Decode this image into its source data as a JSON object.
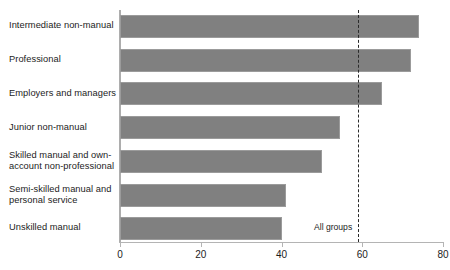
{
  "chart_data": {
    "type": "bar",
    "orientation": "horizontal",
    "title": "",
    "xlabel": "",
    "ylabel": "",
    "xlim": [
      0,
      80
    ],
    "xticks": [
      0,
      20,
      40,
      60,
      80
    ],
    "xtick_labels": [
      "0",
      "20",
      "40",
      "60",
      "80"
    ],
    "grid": false,
    "legend": null,
    "bar_color": "#808080",
    "categories": [
      "Intermediate non-manual",
      "Professional",
      "Employers and managers",
      "Junior non-manual",
      "Skilled manual and own-\naccount non-professional",
      "Semi-skilled manual and\npersonal service",
      "Unskilled manual"
    ],
    "values": [
      74,
      72,
      65,
      54.5,
      50,
      41,
      40
    ],
    "annotations": [
      {
        "name": "all-groups-reference-line",
        "label": "All groups",
        "value": 59,
        "style": "dashed",
        "color": "#2a2a2a"
      }
    ]
  }
}
